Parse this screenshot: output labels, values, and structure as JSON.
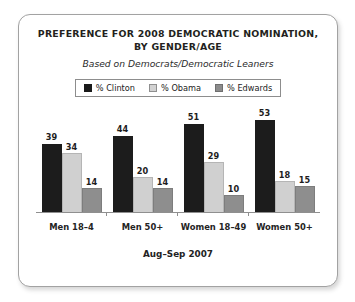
{
  "card": {
    "title_lines": [
      "PREFERENCE FOR 2008 DEMOCRATIC NOMINATION,",
      "BY GENDER/AGE"
    ],
    "subtitle": "Based on Democrats/Democratic Leaners",
    "footer": "Aug–Sep 2007"
  },
  "legend": {
    "items": [
      {
        "label": "% Clinton",
        "swatch": "clinton-swatch",
        "color": "#1a1a1a"
      },
      {
        "label": "% Obama",
        "swatch": "obama-swatch",
        "color": "#d2d2d2"
      },
      {
        "label": "% Edwards",
        "swatch": "edwards-swatch",
        "color": "#8c8c8c"
      }
    ]
  },
  "chart_data": {
    "type": "bar",
    "title": "PREFERENCE FOR 2008 DEMOCRATIC NOMINATION, BY GENDER/AGE",
    "subtitle": "Based on Democrats/Democratic Leaners",
    "annotation": "Aug–Sep 2007",
    "xlabel": "",
    "ylabel": "",
    "ylim": [
      0,
      60
    ],
    "grid": false,
    "legend_position": "top-center",
    "categories": [
      "Men 18–4",
      "Men 50+",
      "Women 18–49",
      "Women 50+"
    ],
    "series": [
      {
        "name": "% Clinton",
        "color": "#1c1c1c",
        "values": [
          39,
          44,
          51,
          53
        ]
      },
      {
        "name": "% Obama",
        "color": "#d0d0d0",
        "values": [
          34,
          20,
          29,
          18
        ]
      },
      {
        "name": "% Edwards",
        "color": "#8e8e8e",
        "values": [
          14,
          14,
          10,
          15
        ]
      }
    ]
  }
}
